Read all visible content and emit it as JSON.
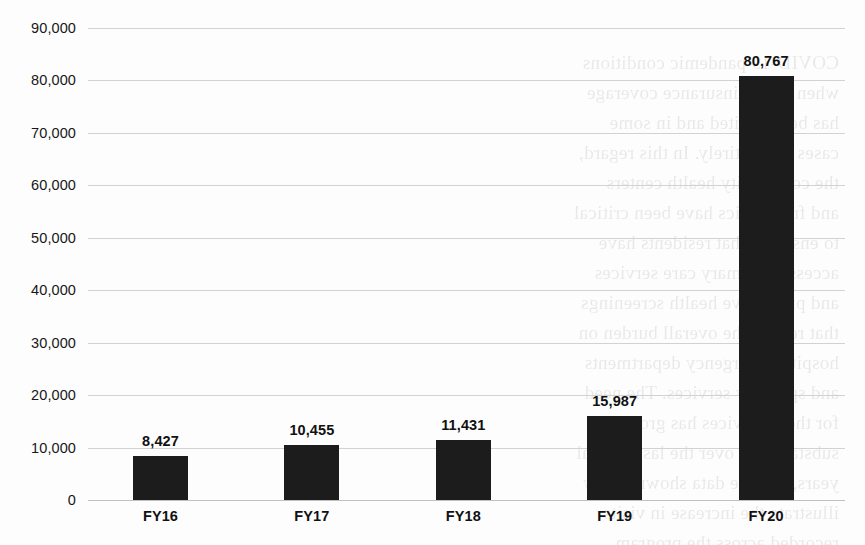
{
  "chart_data": {
    "type": "bar",
    "title": "",
    "subtitle": "",
    "xlabel": "",
    "ylabel": "",
    "categories": [
      "FY16",
      "FY17",
      "FY18",
      "FY19",
      "FY20"
    ],
    "values": [
      8427,
      10455,
      11431,
      15987,
      80767
    ],
    "value_labels": [
      "8,427",
      "10,455",
      "11,431",
      "15,987",
      "80,767"
    ],
    "series": [
      {
        "name": "",
        "values": [
          8427,
          10455,
          11431,
          15987,
          80767
        ]
      }
    ],
    "ylim": [
      0,
      90000
    ],
    "ytick_values": [
      0,
      10000,
      20000,
      30000,
      40000,
      50000,
      60000,
      70000,
      80000,
      90000
    ],
    "ytick_labels": [
      "0",
      "10,000",
      "20,000",
      "30,000",
      "40,000",
      "50,000",
      "60,000",
      "70,000",
      "80,000",
      "90,000"
    ],
    "grid": true,
    "grid_axis": "y",
    "legend": false,
    "legend_position": "none",
    "data_labels_shown": true,
    "bar_color": "#1c1c1c",
    "gridline_color": "#d2d2d2",
    "background_color": "#fdfdfd",
    "text_color": "#111111"
  },
  "artifacts": {
    "bleed_through_text": "COVID-19 pandemic conditions\nwhen health insurance coverage\nhas been limited and in some\ncases lost entirely. In this regard,\nthe community health centers\nand free clinics have been critical\nto ensuring that residents have\naccess to primary care services\nand preventive health screenings\nthat reduce the overall burden on\nhospital emergency departments\nand specialty services. The need\nfor these services has grown\nsubstantially over the last several\nyears, and the data shown below\nillustrate the increase in visits\nrecorded across the program.\nThe numbers reflect both new\nand returning patients who were\nserved during each fiscal year.\nAdditional capacity was added\nin response to demand surges,\nand outreach efforts expanded\nto underserved populations in\nthe surrounding counties."
  }
}
